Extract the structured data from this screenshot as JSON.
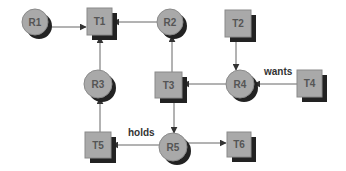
{
  "diagram": {
    "type": "resource-allocation-graph",
    "colors": {
      "node_fill": "#a9a9a9",
      "node_stroke": "#8a8a8a",
      "shadow": "#222222",
      "edge": "#555555",
      "text": "#555555",
      "background": "#ffffff"
    },
    "resources": [
      {
        "id": "R1",
        "label": "R1",
        "cx": 35,
        "cy": 22
      },
      {
        "id": "R2",
        "label": "R2",
        "cx": 170,
        "cy": 22
      },
      {
        "id": "R3",
        "label": "R3",
        "cx": 98,
        "cy": 84
      },
      {
        "id": "R4",
        "label": "R4",
        "cx": 240,
        "cy": 84
      },
      {
        "id": "R5",
        "label": "R5",
        "cx": 173,
        "cy": 147
      }
    ],
    "tasks": [
      {
        "id": "T1",
        "label": "T1",
        "x": 87,
        "y": 8
      },
      {
        "id": "T2",
        "label": "T2",
        "x": 225,
        "y": 10
      },
      {
        "id": "T3",
        "label": "T3",
        "x": 155,
        "y": 72
      },
      {
        "id": "T4",
        "label": "T4",
        "x": 297,
        "y": 70
      },
      {
        "id": "T5",
        "label": "T5",
        "x": 85,
        "y": 132
      },
      {
        "id": "T6",
        "label": "T6",
        "x": 227,
        "y": 132
      }
    ],
    "edges": [
      {
        "from": "R1",
        "to": "T1"
      },
      {
        "from": "R2",
        "to": "T1"
      },
      {
        "from": "R3",
        "to": "T1"
      },
      {
        "from": "T3",
        "to": "R2"
      },
      {
        "from": "T2",
        "to": "R4"
      },
      {
        "from": "R4",
        "to": "T3"
      },
      {
        "from": "T4",
        "to": "R4",
        "label": "wants"
      },
      {
        "from": "T3",
        "to": "R5"
      },
      {
        "from": "T5",
        "to": "R3"
      },
      {
        "from": "R5",
        "to": "T5",
        "label": "holds"
      },
      {
        "from": "R5",
        "to": "T6"
      }
    ],
    "edge_labels": {
      "wants": "wants",
      "holds": "holds"
    }
  }
}
